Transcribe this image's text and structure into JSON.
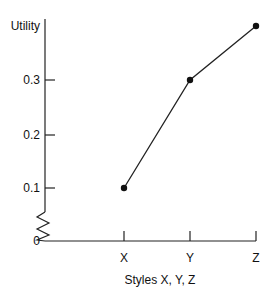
{
  "chart_data": {
    "type": "line",
    "title": "",
    "xlabel": "Styles X, Y, Z",
    "ylabel": "Utility",
    "categories": [
      "X",
      "Y",
      "Z"
    ],
    "values": [
      0.1,
      0.3,
      0.4
    ],
    "yticks": [
      "0",
      "0.1",
      "0.2",
      "0.3"
    ],
    "ylim": [
      0,
      0.4
    ],
    "axis_break": true,
    "grid": false,
    "legend": null,
    "colors": {
      "line": "#222222",
      "marker": "#111111",
      "axis": "#222222"
    }
  }
}
